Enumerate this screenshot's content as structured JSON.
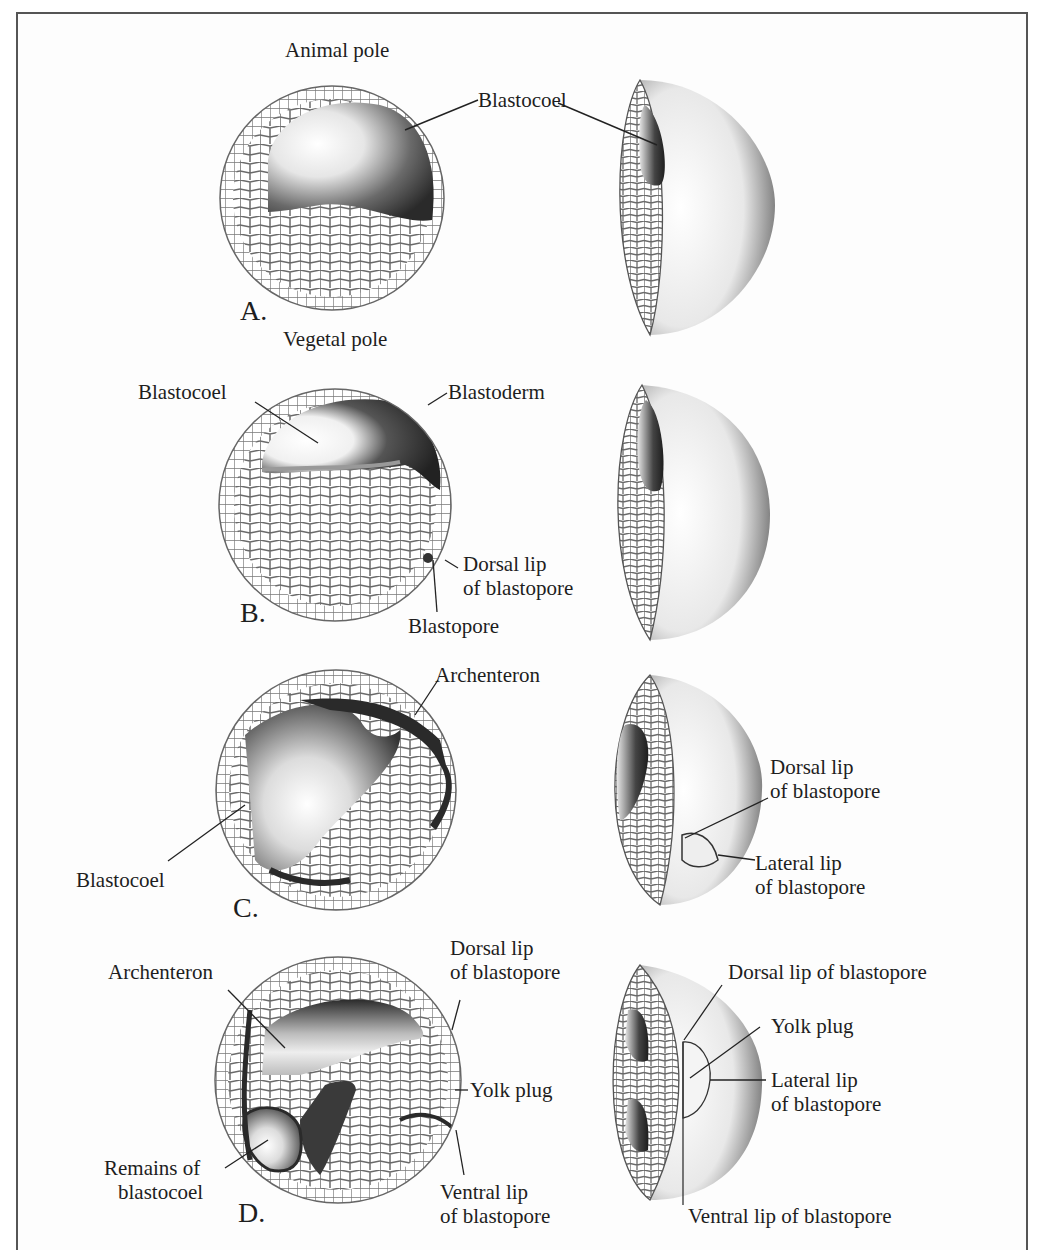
{
  "figure": {
    "colors": {
      "ink": "#1e1e1e",
      "cell_line": "#6a6a6a",
      "dark_cavity": "#2a2a2a",
      "frame": "#555555",
      "background": "#fdfdfd"
    },
    "panels": [
      {
        "stage_label": "A.",
        "section_labels": {
          "top": "Animal pole",
          "bottom": "Vegetal pole",
          "cavity": "Blastocoel"
        },
        "cutaway_labels": {}
      },
      {
        "stage_label": "B.",
        "section_labels": {
          "cavity": "Blastocoel",
          "tissue": "Blastoderm",
          "dorsal_lip_1": "Dorsal lip",
          "dorsal_lip_2": "of blastopore",
          "pore": "Blastopore"
        },
        "cutaway_labels": {}
      },
      {
        "stage_label": "C.",
        "section_labels": {
          "gut": "Archenteron",
          "cavity": "Blastocoel"
        },
        "cutaway_labels": {
          "dorsal_lip_1": "Dorsal lip",
          "dorsal_lip_2": "of blastopore",
          "lateral_lip_1": "Lateral lip",
          "lateral_lip_2": "of blastopore"
        }
      },
      {
        "stage_label": "D.",
        "section_labels": {
          "gut": "Archenteron",
          "dorsal_lip_1": "Dorsal lip",
          "dorsal_lip_2": "of blastopore",
          "yolk_plug": "Yolk plug",
          "remains_1": "Remains of",
          "remains_2": "blastocoel",
          "ventral_lip_1": "Ventral lip",
          "ventral_lip_2": "of blastopore"
        },
        "cutaway_labels": {
          "dorsal_lip": "Dorsal lip of blastopore",
          "yolk_plug": "Yolk plug",
          "lateral_lip_1": "Lateral lip",
          "lateral_lip_2": "of blastopore",
          "ventral_lip": "Ventral lip of blastopore"
        }
      }
    ]
  }
}
